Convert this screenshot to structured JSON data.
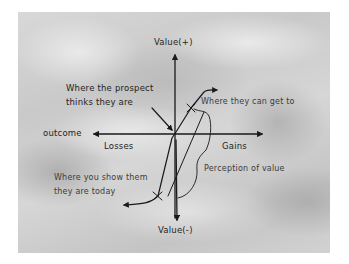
{
  "diagram": {
    "type": "prospect-theory-value-function",
    "axes": {
      "y_top_label": "Value(+)",
      "y_bottom_label": "Value(-)",
      "x_label": "outcome",
      "x_left_label": "Losses",
      "x_right_label": "Gains"
    },
    "annotations": {
      "prospect_thinks": {
        "line1": "Where the prospect",
        "line2": "thinks they are"
      },
      "can_get_to": "Where they can get to",
      "show_them": {
        "line1": "Where you show them",
        "line2": "they are today"
      },
      "perception": "Perception of value"
    },
    "colors": {
      "ink": "#1a1a1a",
      "background": "#cfcfcf",
      "frame": "#ffffff"
    }
  }
}
